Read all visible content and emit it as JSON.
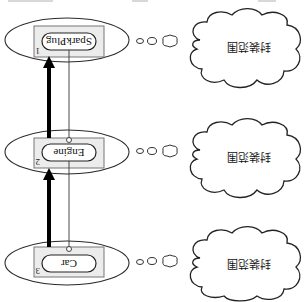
{
  "diagram": {
    "orientation": "rotated-180",
    "top_fragments": [
      "",
      "",
      ""
    ],
    "nodes": [
      {
        "id": 1,
        "number": "1",
        "label": "SparkPlug",
        "cloud_text": "封装范围"
      },
      {
        "id": 2,
        "number": "2",
        "label": "Engine",
        "cloud_text": "封装范围"
      },
      {
        "id": 3,
        "number": "3",
        "label": "Car",
        "cloud_text": "封装范围"
      }
    ],
    "edges": [
      {
        "from": 2,
        "to": 1,
        "style": "thick-arrow"
      },
      {
        "from": 3,
        "to": 2,
        "style": "thick-arrow"
      },
      {
        "from": 1,
        "to": 3,
        "style": "thin-line-with-circle-ends"
      }
    ],
    "colors": {
      "stroke": "#222222",
      "box_fill": "#ececec",
      "background": "#ffffff"
    }
  }
}
